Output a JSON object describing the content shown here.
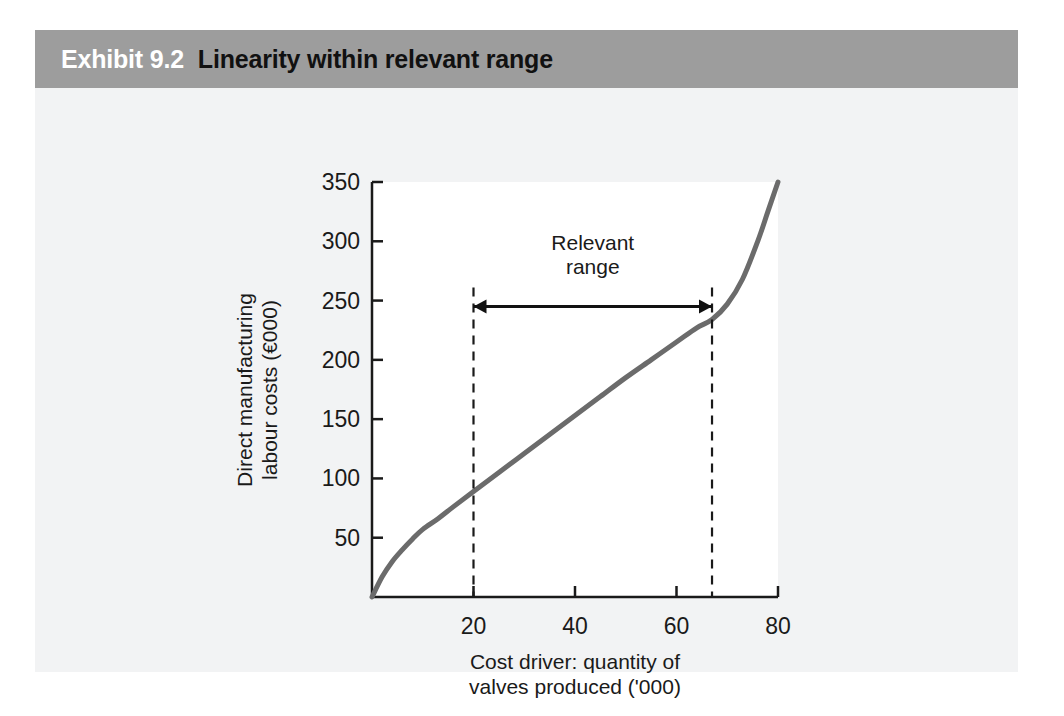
{
  "exhibit": {
    "number": "Exhibit 9.2",
    "title": "Linearity within relevant range",
    "header_bg": "#9d9d9d",
    "number_color": "#ffffff",
    "title_color": "#111111",
    "panel_bg": "#f2f3f4"
  },
  "chart_data": {
    "type": "line",
    "title": "Linearity within relevant range",
    "xlabel_lines": [
      "Cost driver: quantity of",
      "valves produced ('000)"
    ],
    "ylabel_lines": [
      "Direct manufacturing",
      "labour costs (€000)"
    ],
    "xlim": [
      0,
      80
    ],
    "ylim": [
      0,
      350
    ],
    "xticks": [
      20,
      40,
      60,
      80
    ],
    "xtick_labels": [
      "20",
      "40",
      "60",
      "80"
    ],
    "yticks": [
      50,
      100,
      150,
      200,
      250,
      300,
      350
    ],
    "ytick_labels": [
      "50",
      "100",
      "150",
      "200",
      "250",
      "300",
      "350"
    ],
    "grid": false,
    "legend": "none",
    "series": [
      {
        "name": "Direct manufacturing labour cost function",
        "color": "#6b6b6b",
        "x": [
          0,
          2,
          4,
          6,
          8,
          10,
          13,
          16,
          20,
          25,
          30,
          35,
          40,
          45,
          50,
          55,
          60,
          64,
          67,
          70,
          73,
          76,
          78,
          80
        ],
        "y": [
          0,
          17,
          30,
          40,
          49,
          57,
          66,
          76,
          89,
          105,
          121,
          137,
          153,
          169,
          185,
          200,
          215,
          227,
          234,
          247,
          268,
          300,
          325,
          350
        ]
      }
    ],
    "annotations": [
      {
        "name": "relevant-range",
        "label_lines": [
          "Relevant",
          "range"
        ],
        "x_start": 20,
        "x_end": 67,
        "arrow_y_value": 245,
        "marker_style": "dashed-vertical",
        "color": "#111111"
      }
    ]
  }
}
